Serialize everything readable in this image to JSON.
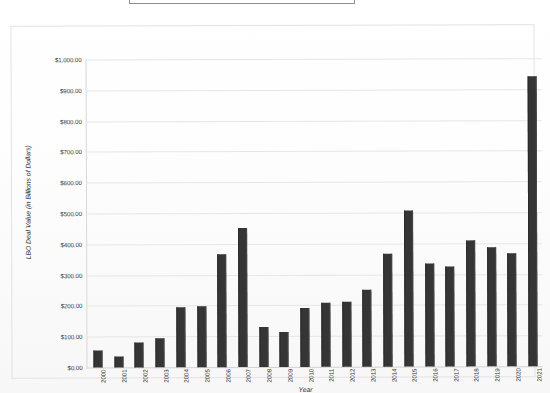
{
  "title_box": {
    "label": ""
  },
  "chart_data": {
    "type": "bar",
    "title": "",
    "xlabel": "Year",
    "ylabel": "LBO Deal Value (in Billions of Dollars)",
    "categories": [
      "2000",
      "2001",
      "2002",
      "2003",
      "2004",
      "2005",
      "2006",
      "2007",
      "2008",
      "2009",
      "2010",
      "2011",
      "2012",
      "2013",
      "2014",
      "2015",
      "2016",
      "2017",
      "2018",
      "2019",
      "2020",
      "2021"
    ],
    "values": [
      55,
      35,
      80,
      95,
      195,
      197,
      368,
      452,
      130,
      115,
      192,
      207,
      212,
      250,
      367,
      505,
      335,
      325,
      408,
      385,
      368,
      940
    ],
    "ylim": [
      0,
      1000
    ],
    "ytick_labels": [
      "$0.00",
      "$100.00",
      "$200.00",
      "$300.00",
      "$400.00",
      "$500.00",
      "$600.00",
      "$700.00",
      "$800.00",
      "$900.00",
      "$1,000.00"
    ],
    "ytick_values": [
      0,
      100,
      200,
      300,
      400,
      500,
      600,
      700,
      800,
      900,
      1000
    ],
    "grid": true,
    "legend": "none",
    "bar_color": "#353535",
    "grid_color": "#e6e6e6",
    "background": "#ffffff"
  }
}
